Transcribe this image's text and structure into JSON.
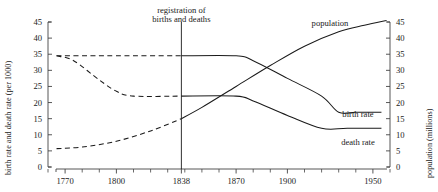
{
  "chart_data": {
    "type": "line",
    "title": "",
    "xlabel": "",
    "ylabel_left": "birth rate and death rate (per 1000)",
    "ylabel_right": "population (millions)",
    "xlim": [
      1760,
      1960
    ],
    "ylim_left": [
      0,
      45
    ],
    "ylim_right": [
      0,
      45
    ],
    "grid": false,
    "legend": "inline-labels",
    "xticks_major": [
      1770,
      1800,
      1838,
      1870,
      1900,
      1950
    ],
    "xtick_labels": [
      "1770",
      "1800",
      "1838",
      "1870",
      "1900",
      "1950"
    ],
    "xticks_minor": [
      1760,
      1780,
      1790,
      1810,
      1820,
      1830,
      1840,
      1850,
      1860,
      1880,
      1890,
      1910,
      1920,
      1930,
      1940,
      1960
    ],
    "yticks": [
      0,
      5,
      10,
      15,
      20,
      25,
      30,
      35,
      40,
      45
    ],
    "ytick_labels": [
      "0",
      "5",
      "10",
      "15",
      "20",
      "25",
      "30",
      "35",
      "40",
      "45"
    ],
    "annotation": {
      "text_line1": "registration of",
      "text_line2": "births and deaths",
      "year": 1838
    },
    "series": [
      {
        "name": "birth rate",
        "label": "birth rate",
        "axis": "left",
        "style_before_1838": "dashed",
        "style_after_1838": "solid",
        "points": [
          {
            "x": 1765,
            "y": 34.5
          },
          {
            "x": 1780,
            "y": 34.5
          },
          {
            "x": 1800,
            "y": 34.5
          },
          {
            "x": 1838,
            "y": 34.5
          },
          {
            "x": 1870,
            "y": 34.5
          },
          {
            "x": 1880,
            "y": 33.0
          },
          {
            "x": 1900,
            "y": 27.5
          },
          {
            "x": 1920,
            "y": 22.0
          },
          {
            "x": 1930,
            "y": 17.0
          },
          {
            "x": 1940,
            "y": 17.0
          },
          {
            "x": 1955,
            "y": 17.0
          }
        ]
      },
      {
        "name": "death rate",
        "label": "death rate",
        "axis": "left",
        "style_before_1838": "dashed",
        "style_after_1838": "solid",
        "points": [
          {
            "x": 1765,
            "y": 34.5
          },
          {
            "x": 1775,
            "y": 33.0
          },
          {
            "x": 1790,
            "y": 27.0
          },
          {
            "x": 1800,
            "y": 23.5
          },
          {
            "x": 1810,
            "y": 22.0
          },
          {
            "x": 1838,
            "y": 22.0
          },
          {
            "x": 1870,
            "y": 22.0
          },
          {
            "x": 1880,
            "y": 20.5
          },
          {
            "x": 1900,
            "y": 16.0
          },
          {
            "x": 1920,
            "y": 12.0
          },
          {
            "x": 1935,
            "y": 12.0
          },
          {
            "x": 1955,
            "y": 12.0
          }
        ]
      },
      {
        "name": "population",
        "label": "population",
        "axis": "right",
        "style_before_1838": "dashed",
        "style_after_1838": "solid",
        "points": [
          {
            "x": 1765,
            "y": 5.7
          },
          {
            "x": 1780,
            "y": 6.2
          },
          {
            "x": 1800,
            "y": 8.0
          },
          {
            "x": 1820,
            "y": 11.2
          },
          {
            "x": 1838,
            "y": 15.0
          },
          {
            "x": 1850,
            "y": 18.5
          },
          {
            "x": 1870,
            "y": 25.0
          },
          {
            "x": 1890,
            "y": 31.5
          },
          {
            "x": 1910,
            "y": 37.5
          },
          {
            "x": 1930,
            "y": 42.0
          },
          {
            "x": 1945,
            "y": 44.0
          },
          {
            "x": 1958,
            "y": 45.5
          }
        ]
      }
    ]
  },
  "labels": {
    "population": "population",
    "birth_rate": "birth rate",
    "death_rate": "death rate",
    "note_line1": "registration of",
    "note_line2": "births and deaths",
    "y_left_title": "birth rate and death rate (per 1000)",
    "y_right_title": "population (millions)"
  },
  "colors": {
    "line": "#1a1a1a",
    "axis": "#444444",
    "background": "#ffffff"
  }
}
